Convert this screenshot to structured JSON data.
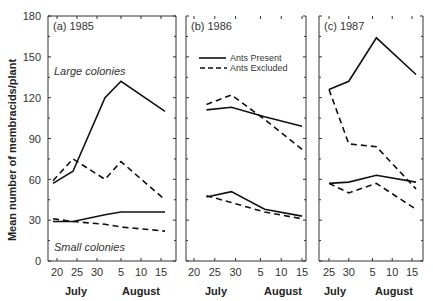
{
  "chart_data": {
    "type": "line",
    "ylabel": "Mean number of membracids/plant",
    "ylim": [
      0,
      180
    ],
    "yticks": [
      0,
      30,
      60,
      90,
      120,
      150,
      180
    ],
    "legend": {
      "position": "upper-left of panel (b)",
      "entries": [
        {
          "label": "Ants Present",
          "style": "solid"
        },
        {
          "label": "Ants Excluded",
          "style": "dashed"
        }
      ]
    },
    "grid": false,
    "panels": [
      {
        "title": "(a) 1985",
        "xtick_labels": [
          "20",
          "25",
          "30",
          "5",
          "10",
          "15"
        ],
        "month_labels": [
          "July",
          "August"
        ],
        "annotations": [
          "Large colonies",
          "Small colonies"
        ],
        "series": [
          {
            "name": "Large colonies - Ants Present",
            "style": "solid",
            "x": [
              "Jul 19",
              "Jul 24",
              "Aug 1",
              "Aug 5",
              "Aug 16"
            ],
            "values": [
              57,
              66,
              120,
              132,
              110
            ]
          },
          {
            "name": "Large colonies - Ants Excluded",
            "style": "dashed",
            "x": [
              "Jul 19",
              "Jul 24",
              "Aug 1",
              "Aug 5",
              "Aug 16"
            ],
            "values": [
              59,
              75,
              60,
              73,
              45
            ]
          },
          {
            "name": "Small colonies - Ants Present",
            "style": "solid",
            "x": [
              "Jul 19",
              "Jul 24",
              "Aug 1",
              "Aug 5",
              "Aug 16"
            ],
            "values": [
              29,
              29,
              34,
              36,
              36
            ]
          },
          {
            "name": "Small colonies - Ants Excluded",
            "style": "dashed",
            "x": [
              "Jul 19",
              "Jul 24",
              "Aug 1",
              "Aug 5",
              "Aug 16"
            ],
            "values": [
              31,
              29,
              27,
              25,
              22
            ]
          }
        ]
      },
      {
        "title": "(b) 1986",
        "xtick_labels": [
          "20",
          "25",
          "30",
          "5",
          "10",
          "15"
        ],
        "month_labels": [
          "July",
          "August"
        ],
        "series": [
          {
            "name": "Large colonies - Ants Present",
            "style": "solid",
            "x": [
              "Jul 23",
              "Jul 29",
              "Aug 6",
              "Aug 15"
            ],
            "values": [
              111,
              113,
              106,
              99
            ]
          },
          {
            "name": "Large colonies - Ants Excluded",
            "style": "dashed",
            "x": [
              "Jul 23",
              "Jul 29",
              "Aug 6",
              "Aug 15"
            ],
            "values": [
              115,
              122,
              104,
              82
            ]
          },
          {
            "name": "Small colonies - Ants Present",
            "style": "solid",
            "x": [
              "Jul 23",
              "Jul 29",
              "Aug 6",
              "Aug 15"
            ],
            "values": [
              47,
              51,
              38,
              33
            ]
          },
          {
            "name": "Small colonies - Ants Excluded",
            "style": "dashed",
            "x": [
              "Jul 23",
              "Jul 29",
              "Aug 6",
              "Aug 15"
            ],
            "values": [
              48,
              43,
              36,
              31
            ]
          }
        ]
      },
      {
        "title": "(c) 1987",
        "xtick_labels": [
          "25",
          "30",
          "5",
          "10",
          "15"
        ],
        "month_labels": [
          "July",
          "August"
        ],
        "series": [
          {
            "name": "Large colonies - Ants Present",
            "style": "solid",
            "x": [
              "Jul 25",
              "Jul 30",
              "Aug 6",
              "Aug 16"
            ],
            "values": [
              126,
              132,
              164,
              137
            ]
          },
          {
            "name": "Large colonies - Ants Excluded",
            "style": "dashed",
            "x": [
              "Jul 25",
              "Jul 30",
              "Aug 6",
              "Aug 16"
            ],
            "values": [
              126,
              86,
              84,
              53
            ]
          },
          {
            "name": "Small colonies - Ants Present",
            "style": "solid",
            "x": [
              "Jul 25",
              "Jul 30",
              "Aug 6",
              "Aug 16"
            ],
            "values": [
              57,
              58,
              63,
              58
            ]
          },
          {
            "name": "Small colonies - Ants Excluded",
            "style": "dashed",
            "x": [
              "Jul 25",
              "Jul 30",
              "Aug 6",
              "Aug 16"
            ],
            "values": [
              57,
              50,
              57,
              38
            ]
          }
        ]
      }
    ]
  },
  "labels": {
    "ylabel": "Mean number of membracids/plant",
    "panel_a_title": "(a) 1985",
    "panel_b_title": "(b) 1986",
    "panel_c_title": "(c) 1987",
    "large_colonies": "Large colonies",
    "small_colonies": "Small colonies",
    "legend_present": "Ants Present",
    "legend_excluded": "Ants Excluded",
    "july": "July",
    "august": "August"
  }
}
